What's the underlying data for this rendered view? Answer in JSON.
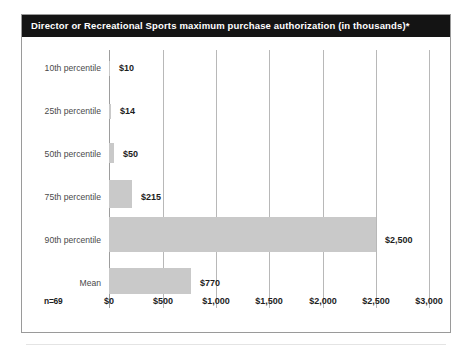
{
  "chart_data": {
    "type": "bar",
    "orientation": "horizontal",
    "title": "Director or Recreational Sports maximum purchase authorization (in thousands)*",
    "xlabel": "",
    "ylabel": "",
    "categories": [
      "10th percentile",
      "25th percentile",
      "50th percentile",
      "75th percentile",
      "90th percentile",
      "Mean"
    ],
    "values": [
      10,
      14,
      50,
      215,
      2500,
      770
    ],
    "value_labels": [
      "$10",
      "$14",
      "$50",
      "$215",
      "$2,500",
      "$770"
    ],
    "xlim": [
      0,
      3000
    ],
    "xticks": [
      0,
      500,
      1000,
      1500,
      2000,
      2500,
      3000
    ],
    "xtick_labels": [
      "$0",
      "$500",
      "$1,000",
      "$1,500",
      "$2,000",
      "$2,500",
      "$3,000"
    ],
    "grid": true,
    "legend": "none",
    "bar_color": "#c9c9c9",
    "sample_size": "n=69",
    "footnote_marker": "*"
  },
  "bars": [
    {
      "label": "10th percentile",
      "value_label": "$10",
      "width_px": 1,
      "height_px": 15,
      "top_px": 6
    },
    {
      "label": "25th percentile",
      "value_label": "$14",
      "width_px": 2,
      "height_px": 15,
      "top_px": 6
    },
    {
      "label": "50th percentile",
      "value_label": "$50",
      "width_px": 5,
      "height_px": 20,
      "top_px": 4
    },
    {
      "label": "75th percentile",
      "value_label": "$215",
      "width_px": 23,
      "height_px": 28,
      "top_px": 2
    },
    {
      "label": "90th percentile",
      "value_label": "$2,500",
      "width_px": 267,
      "height_px": 35,
      "top_px": 0
    },
    {
      "label": "Mean",
      "value_label": "$770",
      "width_px": 82,
      "height_px": 26,
      "top_px": 3
    }
  ],
  "gridlines": [
    {
      "label": "$0",
      "x_px": 87
    },
    {
      "label": "$500",
      "x_px": 141
    },
    {
      "label": "$1,000",
      "x_px": 194
    },
    {
      "label": "$1,500",
      "x_px": 247
    },
    {
      "label": "$2,000",
      "x_px": 301
    },
    {
      "label": "$2,500",
      "x_px": 354
    },
    {
      "label": "$3,000",
      "x_px": 407
    }
  ]
}
